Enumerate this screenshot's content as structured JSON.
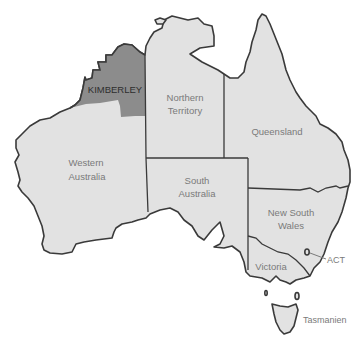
{
  "map": {
    "title": "Australia",
    "colors": {
      "land": "#e2e2e2",
      "highlight": "#8c8c8c",
      "outline": "#3a3a3a",
      "label": "#7a7a7a",
      "highlight_label": "#2e2e2e"
    },
    "highlighted_region": {
      "label": "KIMBERLEY"
    },
    "states": [
      {
        "id": "wa",
        "line1": "Western",
        "line2": "Australia"
      },
      {
        "id": "nt",
        "line1": "Northern",
        "line2": "Territory"
      },
      {
        "id": "qld",
        "line1": "Queensland"
      },
      {
        "id": "sa",
        "line1": "South",
        "line2": "Australia"
      },
      {
        "id": "nsw",
        "line1": "New South",
        "line2": "Wales"
      },
      {
        "id": "vic",
        "line1": "Victoria"
      },
      {
        "id": "act",
        "line1": "ACT"
      },
      {
        "id": "tas",
        "line1": "Tasmanien"
      }
    ]
  }
}
